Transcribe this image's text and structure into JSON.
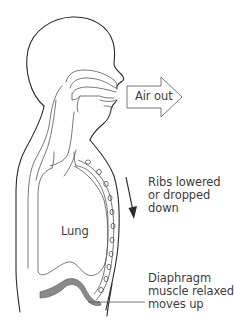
{
  "diagram": {
    "labels": {
      "air_out": "Air out",
      "lung": "Lung",
      "ribs": [
        "Ribs lowered",
        "or dropped",
        "down"
      ],
      "diaphragm": [
        "Diaphragm",
        "muscle relaxed",
        "moves up"
      ]
    },
    "colors": {
      "outline": "#2b2b2b",
      "inner_line": "#555555",
      "diaphragm_fill": "#8a8a8a",
      "arrow_stroke": "#6a6a6a",
      "text": "#3d3d3d",
      "background": "#ffffff"
    },
    "arrows": {
      "air_out": {
        "direction": "right",
        "style": "outline-block"
      },
      "ribs": {
        "direction": "down",
        "style": "solid-line"
      }
    },
    "rib_count": 11
  }
}
